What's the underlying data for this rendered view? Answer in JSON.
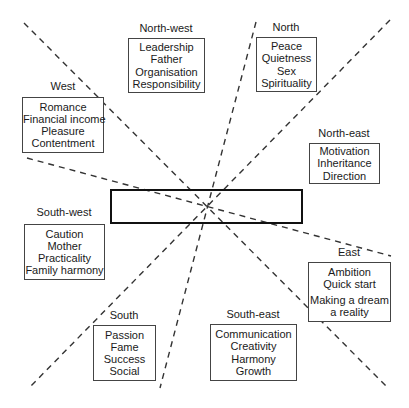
{
  "sectors": [
    {
      "id": "north-west",
      "label": "North-west",
      "items": [
        "Leadership",
        "Father",
        "Organisation",
        "Responsibility"
      ]
    },
    {
      "id": "north",
      "label": "North",
      "items": [
        "Peace",
        "Quietness",
        "Sex",
        "Spirituality"
      ]
    },
    {
      "id": "west",
      "label": "West",
      "items": [
        "Romance",
        "Financial income",
        "Pleasure",
        "Contentment"
      ]
    },
    {
      "id": "north-east",
      "label": "North-east",
      "items": [
        "Motivation",
        "Inheritance",
        "Direction"
      ]
    },
    {
      "id": "south-west",
      "label": "South-west",
      "items": [
        "Caution",
        "Mother",
        "Practicality",
        "Family harmony"
      ]
    },
    {
      "id": "east",
      "label": "East",
      "items": [
        "Ambition",
        "Quick start",
        "Making a dream",
        "a reality"
      ]
    },
    {
      "id": "south",
      "label": "South",
      "items": [
        "Passion",
        "Fame",
        "Success",
        "Social"
      ]
    },
    {
      "id": "south-east",
      "label": "South-east",
      "items": [
        "Communication",
        "Creativity",
        "Harmony",
        "Growth"
      ]
    }
  ],
  "colors": {
    "line": "#333333",
    "box_border": "#444444",
    "text": "#1a1a1a"
  }
}
